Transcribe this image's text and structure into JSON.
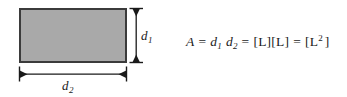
{
  "figure": {
    "shape": {
      "name": "rectangle",
      "fill_color": "#a9a9a9",
      "border_color": "#3b3b3b"
    },
    "dimensions": {
      "height_label": {
        "symbol": "d",
        "subscript": "1"
      },
      "width_label": {
        "symbol": "d",
        "subscript": "2"
      }
    },
    "equation": {
      "area_symbol": "A",
      "equals": "=",
      "first_factor": {
        "symbol": "d",
        "subscript": "1"
      },
      "second_factor": {
        "symbol": "d",
        "subscript": "2"
      },
      "unit_product_open": "[",
      "unit_product_l1": "L",
      "unit_product_mid": "][",
      "unit_product_l2": "L",
      "unit_product_close": "]",
      "result_open": "[",
      "result_base": "L",
      "result_exponent": "2",
      "result_close": "]",
      "plain_text": "A = d1 d2 = [L][L] = [L2]"
    }
  }
}
